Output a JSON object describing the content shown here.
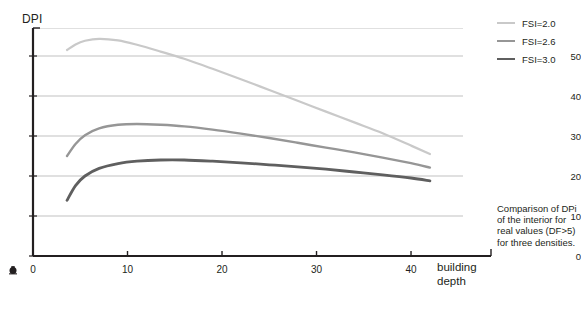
{
  "chart_data": {
    "type": "line",
    "title": "",
    "xlabel": "building depth",
    "ylabel": "DPI",
    "xlim": [
      0,
      45.5
    ],
    "ylim": [
      0,
      57
    ],
    "grid": "horizontal",
    "legend_position": "top-right",
    "x_ticks": [
      0,
      10,
      20,
      30,
      40
    ],
    "y_ticks": [
      0,
      10,
      20,
      30,
      40,
      50
    ],
    "gridlines_y": [
      10,
      20,
      30,
      40,
      50,
      57
    ],
    "series": [
      {
        "name": "FSI=2.0",
        "color": "#c9c9c9",
        "width": 2.2,
        "x": [
          3.6,
          4.5,
          5.5,
          7.0,
          9.0,
          11.0,
          13.5,
          16.0,
          19.0,
          22.0,
          25.0,
          28.0,
          31.0,
          34.0,
          37.0,
          40.0,
          42.0
        ],
        "y": [
          51.5,
          52.9,
          53.8,
          54.3,
          53.9,
          52.8,
          51.1,
          49.3,
          46.8,
          44.2,
          41.5,
          38.8,
          36.1,
          33.4,
          30.7,
          27.6,
          25.5
        ]
      },
      {
        "name": "FSI=2.6",
        "color": "#969696",
        "width": 2.4,
        "x": [
          3.6,
          4.5,
          5.5,
          7.0,
          9.0,
          11.0,
          13.5,
          16.0,
          19.0,
          22.0,
          25.0,
          28.0,
          31.0,
          34.0,
          37.0,
          40.0,
          42.0
        ],
        "y": [
          25.0,
          28.0,
          30.2,
          31.9,
          32.8,
          33.0,
          32.8,
          32.4,
          31.6,
          30.6,
          29.5,
          28.3,
          27.1,
          25.9,
          24.6,
          23.2,
          22.1
        ]
      },
      {
        "name": "FSI=3.0",
        "color": "#5f5f5f",
        "width": 2.8,
        "x": [
          3.6,
          4.5,
          5.5,
          7.0,
          9.0,
          11.0,
          13.5,
          16.0,
          19.0,
          22.0,
          25.0,
          28.0,
          31.0,
          34.0,
          37.0,
          40.0,
          42.0
        ],
        "y": [
          13.9,
          17.6,
          20.0,
          21.9,
          23.1,
          23.7,
          24.0,
          24.0,
          23.7,
          23.3,
          22.8,
          22.3,
          21.7,
          21.0,
          20.3,
          19.5,
          18.8
        ]
      }
    ],
    "caption": "Comparison of DPi of the interior for real values (DF>5) for three densities."
  },
  "legend": {
    "items": [
      {
        "label": "FSI=2.0"
      },
      {
        "label": "FSI=2.6"
      },
      {
        "label": "FSI=3.0"
      }
    ]
  },
  "axes": {
    "y_title": "DPI",
    "x_title_line1": "building",
    "x_title_line2": "depth"
  },
  "colors": {
    "axis": "#231f20",
    "grid": "#a6a6a6",
    "background": "#ffffff"
  }
}
